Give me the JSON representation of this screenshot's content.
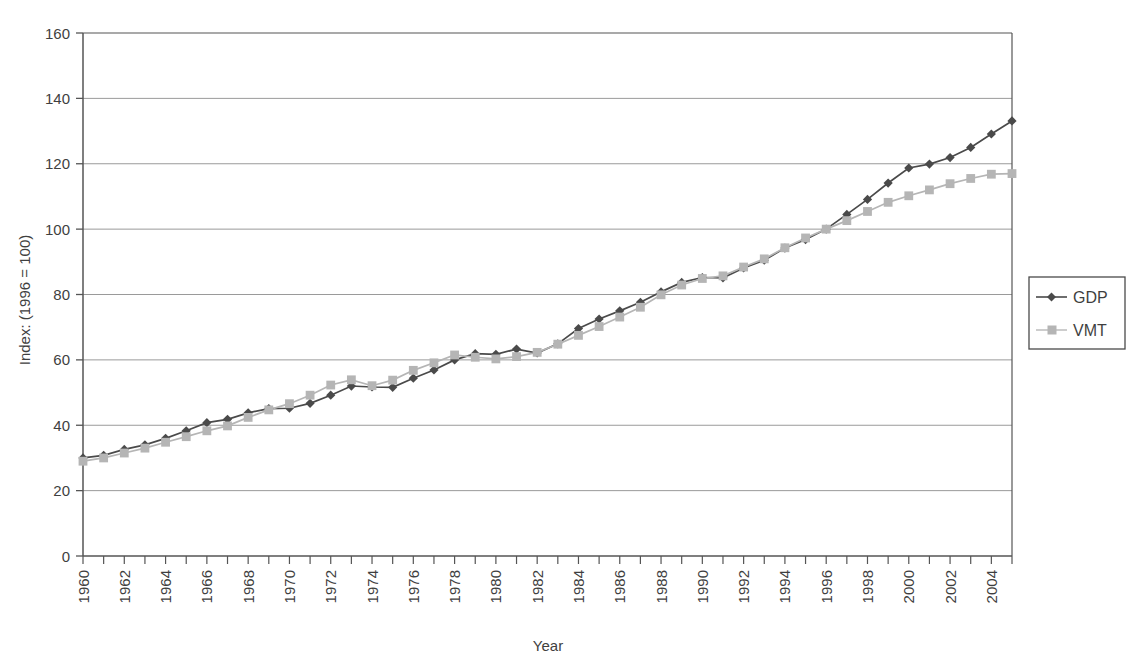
{
  "chart_data": {
    "type": "line",
    "title": "",
    "xlabel": "Year",
    "ylabel": "Index: (1996 = 100)",
    "ylim": [
      0,
      160
    ],
    "ytick_labels": [
      "0",
      "20",
      "40",
      "60",
      "80",
      "100",
      "120",
      "140",
      "160"
    ],
    "yticks": [
      0,
      20,
      40,
      60,
      80,
      100,
      120,
      140,
      160
    ],
    "xlim": [
      1960,
      2005
    ],
    "xtick_labels": [
      "1960",
      "1962",
      "1964",
      "1966",
      "1968",
      "1970",
      "1972",
      "1974",
      "1976",
      "1978",
      "1980",
      "1982",
      "1984",
      "1986",
      "1988",
      "1990",
      "1992",
      "1994",
      "1996",
      "1998",
      "2000",
      "2002",
      "2004"
    ],
    "xticks": [
      1960,
      1962,
      1964,
      1966,
      1968,
      1970,
      1972,
      1974,
      1976,
      1978,
      1980,
      1982,
      1984,
      1986,
      1988,
      1990,
      1992,
      1994,
      1996,
      1998,
      2000,
      2002,
      2004
    ],
    "x": [
      1960,
      1961,
      1962,
      1963,
      1964,
      1965,
      1966,
      1967,
      1968,
      1969,
      1970,
      1971,
      1972,
      1973,
      1974,
      1975,
      1976,
      1977,
      1978,
      1979,
      1980,
      1981,
      1982,
      1983,
      1984,
      1985,
      1986,
      1987,
      1988,
      1989,
      1990,
      1991,
      1992,
      1993,
      1994,
      1995,
      1996,
      1997,
      1998,
      1999,
      2000,
      2001,
      2002,
      2003,
      2004,
      2005
    ],
    "grid": true,
    "grid_axis": "y",
    "legend_position": "right",
    "series": [
      {
        "name": "GDP",
        "color": "#4a4a4a",
        "marker": "diamond",
        "values": [
          30.0,
          30.8,
          32.6,
          34.0,
          36.0,
          38.3,
          40.8,
          41.8,
          43.8,
          45.1,
          45.2,
          46.7,
          49.2,
          52.0,
          51.7,
          51.6,
          54.4,
          56.9,
          60.0,
          61.9,
          61.7,
          63.3,
          62.1,
          64.9,
          69.6,
          72.5,
          75.0,
          77.6,
          80.8,
          83.7,
          85.2,
          85.1,
          88.1,
          90.5,
          94.2,
          96.8,
          100.0,
          104.5,
          109.1,
          114.1,
          118.7,
          119.9,
          121.9,
          125.0,
          129.1,
          133.1
        ]
      },
      {
        "name": "VMT",
        "color": "#b5b5b5",
        "marker": "square",
        "values": [
          29.0,
          30.0,
          31.5,
          33.0,
          34.8,
          36.5,
          38.3,
          39.8,
          42.4,
          44.7,
          46.6,
          49.2,
          52.3,
          53.9,
          52.1,
          53.8,
          56.8,
          59.1,
          61.5,
          60.8,
          60.3,
          61.0,
          62.3,
          64.8,
          67.5,
          70.2,
          73.1,
          76.1,
          79.9,
          82.9,
          84.9,
          85.7,
          88.4,
          90.9,
          94.3,
          97.3,
          100.0,
          102.6,
          105.4,
          108.2,
          110.2,
          112.0,
          113.9,
          115.5,
          116.8,
          117.0
        ]
      }
    ]
  },
  "legend": {
    "entries": [
      {
        "label": "GDP"
      },
      {
        "label": "VMT"
      }
    ]
  }
}
